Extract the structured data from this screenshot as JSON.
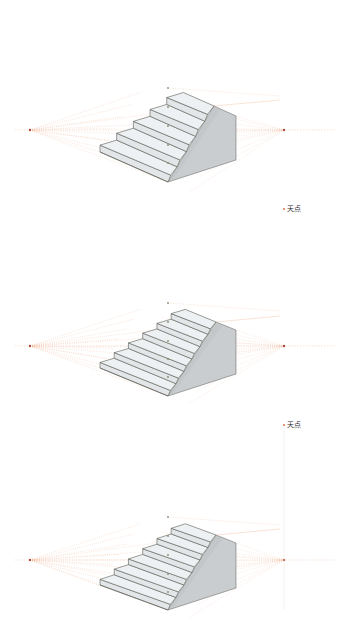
{
  "colors": {
    "guide": "#f0a37a",
    "guide_faint": "#f3c7ad",
    "vp": "#b04a3a",
    "outline": "#5a5a52",
    "tread": "#eef1f3",
    "riser": "#e2e6e9",
    "side": "#c9cdd0",
    "side_dark": "#bfc3c7",
    "center_mark": "#8a8a6a"
  },
  "diagrams": [
    {
      "id": "stairs-1",
      "horizon_y": 130,
      "vp_left": [
        30,
        130
      ],
      "vp_right": [
        284,
        130
      ],
      "center_x": 168,
      "center_marks_y": [
        88,
        107,
        126,
        145,
        163
      ],
      "steps": 5,
      "front_bottom": [
        168,
        182
      ],
      "left_bottom": [
        100,
        152
      ],
      "top_front": [
        214,
        106
      ],
      "back_top": [
        236,
        116
      ],
      "back_bottom": [
        236,
        160
      ],
      "label": null
    },
    {
      "id": "stairs-2",
      "horizon_y": 346,
      "vp_left": [
        30,
        346
      ],
      "vp_right": [
        284,
        346
      ],
      "center_x": 168,
      "center_marks_y": [
        303,
        322,
        341,
        359,
        377
      ],
      "steps": 6,
      "front_bottom": [
        168,
        396
      ],
      "left_bottom": [
        100,
        368
      ],
      "top_front": [
        216,
        322
      ],
      "back_top": [
        236,
        330
      ],
      "back_bottom": [
        236,
        374
      ],
      "label": {
        "text": "天点",
        "x": 283,
        "y": 207
      }
    },
    {
      "id": "stairs-3",
      "horizon_y": 560,
      "vp_left": [
        30,
        560
      ],
      "vp_right": [
        284,
        560
      ],
      "center_x": 168,
      "center_marks_y": [
        517,
        536,
        555,
        574,
        592
      ],
      "steps": 6,
      "front_bottom": [
        168,
        610
      ],
      "left_bottom": [
        100,
        585
      ],
      "top_front": [
        216,
        535
      ],
      "back_top": [
        236,
        543
      ],
      "back_bottom": [
        236,
        588
      ],
      "label": {
        "text": "天点",
        "x": 283,
        "y": 423
      },
      "zenith_line": {
        "x": 284,
        "y1": 428,
        "y2": 610
      }
    }
  ],
  "labels": [
    {
      "text": "天点",
      "x": 283,
      "y": 207
    },
    {
      "text": "天点",
      "x": 283,
      "y": 423
    }
  ]
}
